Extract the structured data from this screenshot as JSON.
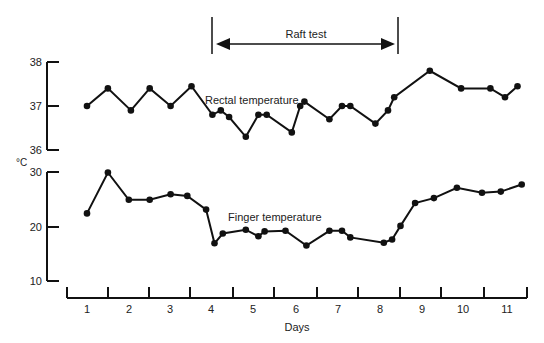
{
  "chart_data": {
    "type": "line",
    "title": "",
    "xlabel": "Days",
    "ylabel": "°C",
    "x_ticks": [
      "1",
      "2",
      "3",
      "4",
      "5",
      "6",
      "7",
      "8",
      "9",
      "10",
      "11"
    ],
    "xlim": [
      0.5,
      11.5
    ],
    "annotation": {
      "label": "Raft test",
      "start_day": 4.0,
      "end_day": 8.5
    },
    "panels": [
      {
        "name": "rectal",
        "ylim": [
          36,
          38
        ],
        "yticks": [
          "36",
          "37",
          "38"
        ],
        "series": [
          {
            "name": "Rectal temperature",
            "x": [
              1.0,
              1.5,
              2.05,
              2.5,
              3.0,
              3.5,
              4.0,
              4.2,
              4.4,
              4.8,
              5.1,
              5.3,
              5.9,
              6.1,
              6.2,
              6.8,
              7.1,
              7.3,
              7.9,
              8.2,
              8.35,
              9.2,
              9.95,
              10.65,
              11.0,
              11.3
            ],
            "values": [
              37.0,
              37.4,
              36.9,
              37.4,
              37.0,
              37.45,
              36.8,
              36.9,
              36.75,
              36.3,
              36.8,
              36.8,
              36.4,
              37.0,
              37.1,
              36.7,
              37.0,
              37.0,
              36.6,
              36.9,
              37.2,
              37.8,
              37.4,
              37.4,
              37.2,
              37.45
            ]
          }
        ]
      },
      {
        "name": "finger",
        "ylim": [
          10,
          30
        ],
        "yticks": [
          "10",
          "20",
          "30"
        ],
        "series": [
          {
            "name": "Finger temperature",
            "x": [
              1.0,
              1.5,
              2.0,
              2.5,
              3.0,
              3.4,
              3.85,
              4.05,
              4.25,
              4.8,
              5.1,
              5.25,
              5.75,
              6.25,
              6.8,
              7.1,
              7.3,
              8.1,
              8.3,
              8.5,
              8.85,
              9.3,
              9.85,
              10.45,
              10.9,
              11.4
            ],
            "values": [
              22.5,
              30.0,
              25.0,
              25.0,
              26.0,
              25.7,
              23.2,
              17.0,
              18.8,
              19.5,
              18.3,
              19.2,
              19.3,
              16.6,
              19.3,
              19.3,
              18.1,
              17.1,
              17.7,
              20.2,
              24.4,
              25.3,
              27.2,
              26.3,
              26.5,
              27.8
            ]
          }
        ]
      }
    ]
  },
  "labels": {
    "raft_test": "Raft test",
    "rectal_series": "Rectal temperature",
    "finger_series": "Finger temperature",
    "y_unit": "°C",
    "x_axis_title": "Days"
  }
}
